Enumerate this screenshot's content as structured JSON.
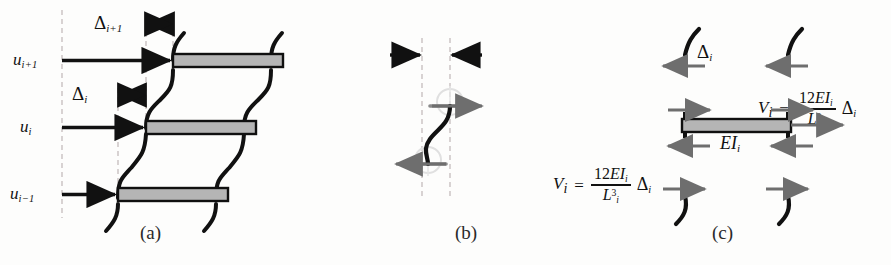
{
  "figure": {
    "background": "#fdfdfc",
    "ink": "#111111",
    "bar_fill": "#b5b5b5",
    "bar_stroke": "#101010",
    "dash_color": "#cfc8c8",
    "gray_arrow": "#5a5a5a",
    "ghost_ring": "#dcdcdc"
  },
  "panels": {
    "a": {
      "caption": "(a)",
      "displacement_labels": [
        {
          "id": "u-i-plus-1",
          "base": "u",
          "sub": "i+1"
        },
        {
          "id": "u-i",
          "base": "u",
          "sub": "i"
        },
        {
          "id": "u-i-minus-1",
          "base": "u",
          "sub": "i−1"
        }
      ],
      "drift_labels": [
        {
          "id": "delta-i-plus-1",
          "base": "Δ",
          "sub": "i+1"
        },
        {
          "id": "delta-i",
          "base": "Δ",
          "sub": "i"
        }
      ],
      "floor_count": 3
    },
    "b": {
      "caption": "(b)",
      "drift_label": {
        "base": "Δ",
        "sub": "i"
      },
      "stiffness_label": {
        "base": "EI",
        "sub": "i"
      },
      "equations": [
        {
          "id": "shear-eq-top",
          "lhs": "V",
          "lhs_sub": "i",
          "equals": "=",
          "num_coeff": "12",
          "num_sym": "EI",
          "num_sub": "i",
          "den_sym": "L",
          "den_sub": "i",
          "den_sup": "3",
          "tail": "Δ",
          "tail_sub": "i"
        },
        {
          "id": "shear-eq-bottom",
          "lhs": "V",
          "lhs_sub": "i",
          "equals": "=",
          "num_coeff": "12",
          "num_sym": "EI",
          "num_sub": "i",
          "den_sym": "L",
          "den_sub": "i",
          "den_sup": "3",
          "tail": "Δ",
          "tail_sub": "i"
        }
      ]
    },
    "c": {
      "caption": "(c)",
      "mass_label": {
        "base": "m",
        "sub": "i"
      },
      "force_label": {
        "base": "f",
        "sub": "i"
      },
      "shear_labels": [
        {
          "id": "shear-top-left",
          "base": "V",
          "sub": "i+1"
        },
        {
          "id": "shear-top-right",
          "base": "V",
          "sub": "i+1"
        },
        {
          "id": "shear-bottom-left",
          "base": "V",
          "sub": "i"
        },
        {
          "id": "shear-bottom-right",
          "base": "V",
          "sub": "i"
        }
      ]
    }
  }
}
